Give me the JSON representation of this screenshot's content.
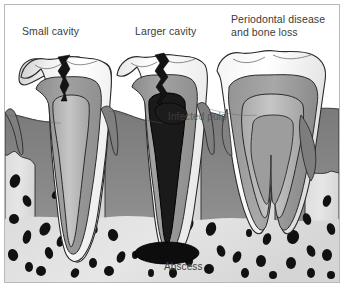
{
  "figure": {
    "type": "medical-illustration",
    "frame": {
      "border_color": "#b9b9b9",
      "background": "#ffffff"
    },
    "labels": {
      "small_cavity": "Small cavity",
      "larger_cavity": "Larger cavity",
      "periodontal": "Periodontal disease\nand bone loss",
      "infected_pulp": "Infected pulp",
      "abscess": "Abscess"
    },
    "colors": {
      "enamel": "#ffffff",
      "enamel_shade": "#e8e8e8",
      "dentin": "#9a9a9a",
      "dentin_dark": "#8a8a8a",
      "pulp": "#b4b4b4",
      "pulp_light": "#c4c4c4",
      "gingiva": "#8f8f8f",
      "gingiva_dark": "#7d7d7d",
      "bone": "#d8d8d8",
      "bone_light": "#e2e2e2",
      "trabecula": "#111111",
      "cavity": "#141414",
      "infected_canal": "#151515",
      "abscess": "#0d0d0d",
      "outline": "#2a2a2a",
      "text": "#3b3b3b"
    },
    "teeth": [
      {
        "id": "tooth-left",
        "name": "Small cavity tooth",
        "condition": "small cavity",
        "roots": 1,
        "crack_depth": "into enamel and dentin",
        "pulp_state": "healthy",
        "bone_level": "normal"
      },
      {
        "id": "tooth-middle",
        "name": "Larger cavity tooth",
        "condition": "larger cavity with infected pulp and periapical abscess",
        "roots": 1,
        "crack_depth": "through enamel, dentin and into pulp",
        "pulp_state": "infected",
        "bone_level": "normal"
      },
      {
        "id": "tooth-right",
        "name": "Periodontal disease tooth",
        "condition": "periodontal disease and bone loss",
        "roots": 2,
        "crack_depth": "none",
        "pulp_state": "healthy",
        "bone_level": "reduced"
      }
    ]
  }
}
